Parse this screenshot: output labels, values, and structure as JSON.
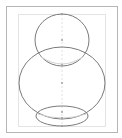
{
  "diagram": {
    "colors": {
      "stroke": "#7a7a7a",
      "guide": "#d8d8d8",
      "frame": "#b5b5b5",
      "inner_frame": "#e4e4e4",
      "point": "#9a9a9a"
    },
    "shapes": [
      {
        "name": "top-circle",
        "cx": 62,
        "cy": 40,
        "rx": 27,
        "ry": 26
      },
      {
        "name": "middle-ellipse",
        "cx": 62,
        "cy": 83,
        "rx": 43,
        "ry": 36
      },
      {
        "name": "bottom-ellipse",
        "cx": 62,
        "cy": 116,
        "rx": 26,
        "ry": 10
      }
    ]
  }
}
